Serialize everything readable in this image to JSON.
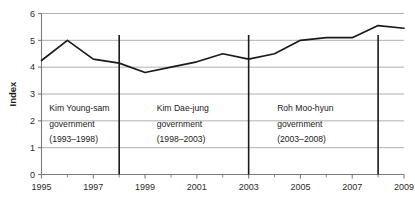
{
  "chart_data": {
    "type": "line",
    "title": "",
    "xlabel": "",
    "ylabel": "Index",
    "xlim": [
      1995,
      2009
    ],
    "ylim": [
      0,
      6
    ],
    "grid": true,
    "legend": "none",
    "x": [
      1995,
      1996,
      1997,
      1998,
      1999,
      2000,
      2001,
      2002,
      2003,
      2004,
      2005,
      2006,
      2007,
      2008,
      2009
    ],
    "series": [
      {
        "name": "Index",
        "color": "#1a1a1a",
        "values": [
          4.25,
          5.0,
          4.3,
          4.15,
          3.8,
          4.0,
          4.2,
          4.5,
          4.3,
          4.5,
          5.0,
          5.1,
          5.1,
          5.55,
          5.45
        ]
      }
    ],
    "y_ticks": [
      "0",
      "1",
      "2",
      "3",
      "4",
      "5",
      "6"
    ],
    "y_tick_values": [
      0,
      1,
      2,
      3,
      4,
      5,
      6
    ],
    "x_ticks": [
      "1995",
      "1997",
      "1999",
      "2001",
      "2003",
      "2005",
      "2007",
      "2009"
    ],
    "x_tick_values": [
      1995,
      1997,
      1999,
      2001,
      2003,
      2005,
      2007,
      2009
    ],
    "x_minor_ticks": [
      1996,
      1998,
      2000,
      2002,
      2004,
      2006,
      2008
    ],
    "dividers": [
      {
        "name": "divider-1998",
        "x": 1998
      },
      {
        "name": "divider-2003",
        "x": 2003
      },
      {
        "name": "divider-2008",
        "x": 2008
      }
    ],
    "annotations": [
      {
        "name": "annotation-kim-young-sam",
        "x": 1995.3,
        "y": 2.35,
        "lines": [
          "Kim Young-sam",
          "government",
          "(1993–1998)"
        ]
      },
      {
        "name": "annotation-kim-dae-jung",
        "x": 1999.45,
        "y": 2.35,
        "lines": [
          "Kim Dae-jung",
          "government",
          "(1998–2003)"
        ]
      },
      {
        "name": "annotation-roh-moo-hyun",
        "x": 2004.1,
        "y": 2.35,
        "lines": [
          "Roh Moo-hyun",
          "government",
          "(2003–2008)"
        ]
      }
    ]
  },
  "style": {
    "line_color": "#1a1a1a",
    "grid_color": "#a6a6a6",
    "axis_color": "#7a7a7a",
    "divider_color": "#1a1a1a",
    "background": "#ffffff",
    "text_color": "#1a1a1a"
  }
}
